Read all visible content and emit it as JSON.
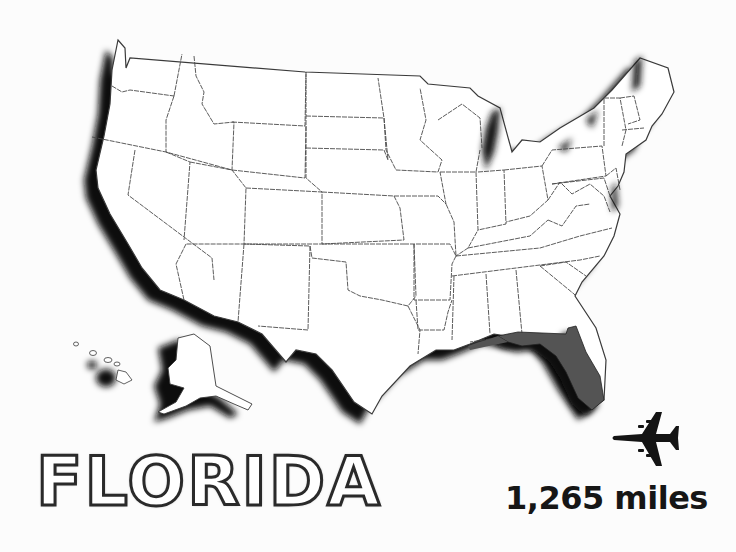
{
  "map": {
    "subject": "Contiguous United States with Alaska and Hawaii insets",
    "highlighted_state": "Florida",
    "colors": {
      "background": "#fcfcfc",
      "land": "#ffffff",
      "border": "#444444",
      "shadow": "#111111",
      "highlight": "#555555"
    }
  },
  "label": {
    "state_name": "FLORIDA",
    "distance": "1,265 miles"
  },
  "icons": {
    "airplane": "airplane-icon"
  }
}
